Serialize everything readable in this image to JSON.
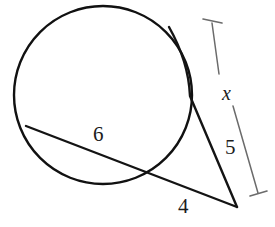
{
  "figure": {
    "type": "geometry-diagram",
    "width": 275,
    "height": 227,
    "background_color": "#ffffff",
    "stroke_color": "#111111",
    "bracket_color": "#6b6b6b"
  },
  "labels": {
    "chord_label": "6",
    "external_secant_label": "4",
    "tangent_lower_label": "5",
    "bracket_label": "x"
  },
  "geometry": {
    "circle": {
      "name": "main-circle",
      "cx": 103,
      "cy": 95,
      "r": 89,
      "stroke_width": 2.4
    },
    "external_point": {
      "name": "vertex",
      "x": 237,
      "y": 207
    },
    "secant_line": {
      "name": "secant-through-circle",
      "from": {
        "x": 26,
        "y": 126
      },
      "to": {
        "x": 237,
        "y": 207
      },
      "near_circle_crossing": {
        "x": 156,
        "y": 176
      },
      "stroke_width": 2.4
    },
    "tangent_line": {
      "name": "second-secant-line",
      "from": {
        "x": 169,
        "y": 27
      },
      "to": {
        "x": 237,
        "y": 207
      },
      "near_circle_crossing": {
        "x": 190,
        "y": 96
      },
      "stroke_width": 2.4
    },
    "bracket": {
      "name": "x-measure-bracket",
      "top_anchor": {
        "x": 212,
        "y": 23
      },
      "bottom_anchor": {
        "x": 258,
        "y": 193
      },
      "top_tick": {
        "x1": 203,
        "y1": 19,
        "x2": 222,
        "y2": 23
      },
      "bottom_tick": {
        "x1": 250,
        "y1": 196,
        "x2": 267,
        "y2": 191
      },
      "gap_start": {
        "x": 219,
        "y": 74
      },
      "gap_end": {
        "x": 233,
        "y": 106
      },
      "stroke_width": 1.5
    }
  }
}
